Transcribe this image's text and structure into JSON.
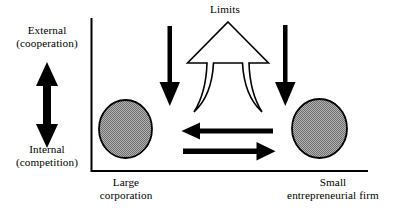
{
  "diagram": {
    "title_text": "Limits",
    "axis_labels": {
      "top_line1": "External",
      "top_line2": "(cooperation)",
      "bottom_line1": "Internal",
      "bottom_line2": "(competition)"
    },
    "nodes": [
      {
        "id": "large-corporation",
        "label_line1": "Large",
        "label_line2": "corporation",
        "shape": "circle",
        "fill": "#a0a0a0"
      },
      {
        "id": "small-entrepreneurial-firm",
        "label_line1": "Small",
        "label_line2": "entrepreneurial firm",
        "shape": "circle",
        "fill": "#a0a0a0"
      }
    ],
    "arrows": [
      {
        "id": "vertical-double-arrow",
        "direction": "up-down",
        "style": "solid-filled"
      },
      {
        "id": "left-down-arrow",
        "direction": "down",
        "style": "solid-filled"
      },
      {
        "id": "right-down-arrow",
        "direction": "down",
        "style": "solid-filled"
      },
      {
        "id": "limits-flared-arrow",
        "direction": "up",
        "style": "outline-hollow"
      },
      {
        "id": "right-to-left-arrow",
        "direction": "left",
        "style": "solid-filled"
      },
      {
        "id": "left-to-right-arrow",
        "direction": "right",
        "style": "solid-filled"
      }
    ],
    "colors": {
      "stroke": "#000000",
      "circle_fill": "#a0a0a0",
      "background": "#ffffff"
    }
  }
}
